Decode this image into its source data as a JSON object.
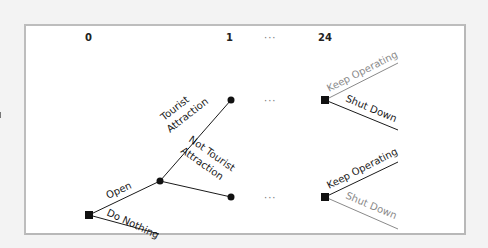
{
  "diagram": {
    "type": "decision-tree",
    "stages": [
      {
        "id": "stage-0",
        "label": "0"
      },
      {
        "id": "stage-1",
        "label": "1"
      },
      {
        "id": "stage-ellipsis",
        "label": "···"
      },
      {
        "id": "stage-24",
        "label": "24"
      }
    ],
    "root_decision": {
      "node": "decision",
      "branches": [
        {
          "label": "Open",
          "emphasis": "normal"
        },
        {
          "label": "Do Nothing",
          "emphasis": "normal"
        }
      ]
    },
    "chance_node": {
      "node": "chance",
      "branches": [
        {
          "label_line1": "Tourist",
          "label_line2": "Attraction"
        },
        {
          "label_line1": "Not Tourist",
          "label_line2": "Attraction"
        }
      ]
    },
    "ellipses": [
      "···",
      "···"
    ],
    "final_decisions": [
      {
        "after": "Tourist Attraction",
        "branches": [
          {
            "label": "Keep Operating",
            "emphasis": "muted"
          },
          {
            "label": "Shut Down",
            "emphasis": "chosen"
          }
        ]
      },
      {
        "after": "Not Tourist Attraction",
        "branches": [
          {
            "label": "Keep Operating",
            "emphasis": "chosen"
          },
          {
            "label": "Shut Down",
            "emphasis": "muted"
          }
        ]
      }
    ],
    "colors": {
      "line": "#1a1a1a",
      "muted": "#8a8a8a",
      "frame_border": "#bdbdbd",
      "background": "#f3f3f3"
    }
  }
}
